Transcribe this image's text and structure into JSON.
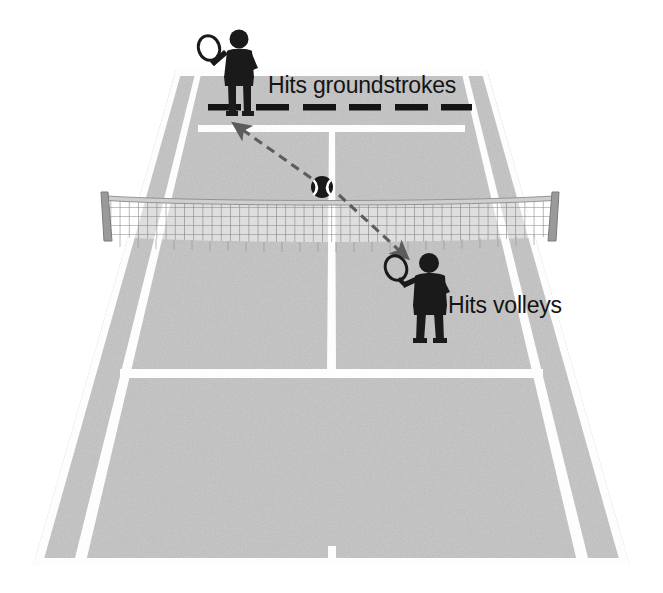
{
  "diagram": {
    "surface_color": "#c9c9c9",
    "line_color": "#ffffff",
    "figure_color": "#1a1a1a",
    "net_color": "#8a8a8a",
    "background_color": "#ffffff"
  },
  "labels": {
    "groundstrokes": "Hits groundstrokes",
    "volleys": "Hits volleys"
  },
  "players": [
    {
      "id": "baseline-player",
      "role": "Hits groundstrokes",
      "position": "far baseline",
      "holds": "racket"
    },
    {
      "id": "net-player",
      "role": "Hits volleys",
      "position": "near service box",
      "holds": "racket"
    }
  ],
  "court": {
    "elements": [
      "far-baseline",
      "near-baseline",
      "left-sideline",
      "right-sideline",
      "left-doubles-alley",
      "right-doubles-alley",
      "far-service-line",
      "near-service-line",
      "center-service-line",
      "center-mark",
      "net"
    ],
    "dashed_marker": {
      "name": "baseline-dashed-line",
      "dash_count": 6,
      "color": "#111111"
    }
  },
  "ball": {
    "name": "tennis-ball",
    "color": "#1a1a1a",
    "seam_color": "#ffffff"
  },
  "arrows": [
    {
      "id": "arrow-to-baseline",
      "direction": "up-left",
      "meaning": "ball travels toward baseline player"
    },
    {
      "id": "arrow-to-net",
      "direction": "down-right",
      "meaning": "ball travels toward net player"
    }
  ]
}
